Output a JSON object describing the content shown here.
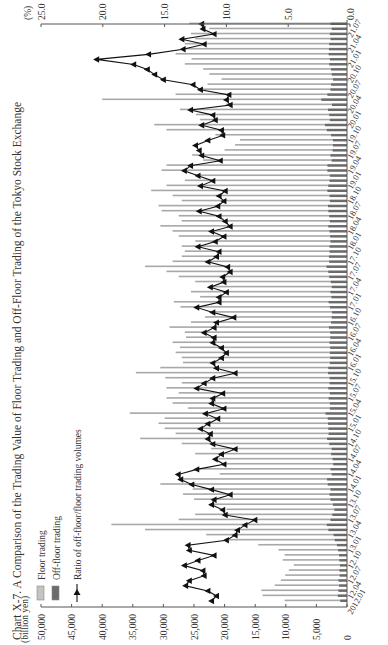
{
  "chart_data": {
    "type": "bar",
    "orientation": "rotated-90-ccw",
    "title": "Chart X-7.   A Comparison of the Trading Value of Floor Trading and Off-Floor Trading of the Tokyo Stock Exchange",
    "ylabel_left": "(billion yen)",
    "ylabel_right": "(%)",
    "ylim_left": [
      0,
      50000
    ],
    "ylim_right": [
      0,
      25
    ],
    "left_ticks": [
      "0",
      "5,000",
      "10,000",
      "15,000",
      "20,000",
      "25,000",
      "30,000",
      "35,000",
      "40,000",
      "45,000",
      "50,000"
    ],
    "right_ticks": [
      "0.0",
      "5.0",
      "10.0",
      "15.0",
      "20.0",
      "25.0"
    ],
    "x_tick_labels": [
      "2012.01",
      "12.04",
      "12.07",
      "12.10",
      "13.01",
      "13.04",
      "13.07",
      "13.10",
      "14.01",
      "14.04",
      "14.07",
      "14.10",
      "15.01",
      "15.04",
      "15.07",
      "15.10",
      "16.01",
      "16.04",
      "16.07",
      "16.10",
      "17.01",
      "17.04",
      "17.07",
      "17.10",
      "18.01",
      "18.04",
      "18.07",
      "18.10",
      "19.01",
      "19.04",
      "19.07",
      "19.10",
      "20.01",
      "20.04",
      "20.07",
      "20.10",
      "21.01",
      "21.04",
      "21.07"
    ],
    "legend": [
      "Floor trading",
      "Off-floor trading",
      "Ratio of off-floor/floor trading volumes"
    ],
    "grid": false,
    "series": [
      {
        "name": "Floor trading",
        "type": "bar",
        "axis": "left",
        "values": [
          10200,
          13800,
          14000,
          11800,
          10800,
          10100,
          9500,
          8700,
          10500,
          10200,
          11200,
          14500,
          20000,
          23000,
          33000,
          38500,
          27500,
          24800,
          19700,
          22500,
          25000,
          26800,
          25200,
          30500,
          27000,
          20800,
          24500,
          20600,
          21000,
          24800,
          22200,
          27000,
          33800,
          28000,
          29800,
          30800,
          29800,
          35500,
          26000,
          28500,
          29500,
          27500,
          29500,
          27000,
          29700,
          34500,
          30500,
          26800,
          27000,
          28000,
          27300,
          28500,
          26300,
          26500,
          29000,
          25500,
          23200,
          22500,
          27200,
          28300,
          24000,
          25500,
          22200,
          24800,
          27500,
          29500,
          33000,
          28500,
          27000,
          26500,
          27000,
          24800,
          27500,
          28500,
          30500,
          27000,
          27500,
          30300,
          30800,
          27000,
          28500,
          32000,
          29500,
          26500,
          24800,
          30300,
          29500,
          23500,
          25300,
          20000,
          18300,
          17500,
          21500,
          29500,
          31500,
          24000,
          24700,
          27300,
          19800,
          40000,
          28000,
          23500,
          22800,
          20500,
          22500,
          23500,
          26500,
          25400,
          28000,
          27000,
          26500,
          24800,
          25500,
          22500,
          25800
        ]
      },
      {
        "name": "Off-floor trading",
        "type": "bar",
        "axis": "left",
        "values": [
          1100,
          1500,
          1400,
          1300,
          1400,
          1200,
          1250,
          1150,
          1250,
          1300,
          1450,
          1650,
          2000,
          2200,
          3050,
          3300,
          2700,
          2400,
          2050,
          2300,
          2700,
          2850,
          2700,
          3150,
          3250,
          2500,
          2700,
          2250,
          2350,
          2600,
          2500,
          2900,
          3250,
          3000,
          3050,
          3100,
          3150,
          3500,
          2800,
          2800,
          3000,
          2800,
          3050,
          2850,
          2850,
          3100,
          3050,
          2800,
          2750,
          2800,
          2750,
          2850,
          2750,
          2750,
          2950,
          2600,
          2500,
          2450,
          2800,
          3000,
          2550,
          2700,
          2500,
          2650,
          2900,
          3050,
          3350,
          2900,
          2950,
          2850,
          2850,
          2700,
          2750,
          2850,
          3050,
          2800,
          2900,
          3050,
          3100,
          2800,
          2850,
          3200,
          3050,
          2850,
          2800,
          3200,
          3200,
          2500,
          2700,
          2350,
          2300,
          2300,
          2600,
          3300,
          3600,
          2800,
          2900,
          3100,
          2450,
          4200,
          3200,
          2700,
          2600,
          2300,
          2500,
          2600,
          2900,
          2800,
          3000,
          2950,
          2900,
          2700,
          2800,
          2500,
          2700
        ]
      },
      {
        "name": "Ratio of off-floor/floor trading volumes",
        "type": "line",
        "axis": "right",
        "values": [
          11.2,
          10.8,
          11.5,
          13.3,
          13.0,
          11.8,
          11.9,
          13.4,
          12.3,
          11.0,
          13.0,
          13.1,
          10.0,
          9.3,
          9.1,
          8.5,
          7.7,
          10.1,
          10.3,
          11.2,
          11.0,
          9.7,
          11.2,
          12.8,
          13.7,
          13.9,
          12.4,
          10.2,
          10.9,
          10.4,
          9.3,
          11.1,
          11.5,
          11.3,
          12.1,
          11.5,
          10.7,
          11.7,
          10.2,
          11.2,
          11.1,
          10.3,
          12.4,
          11.8,
          11.1,
          9.3,
          10.8,
          11.1,
          10.4,
          10.0,
          10.4,
          11.1,
          11.0,
          11.8,
          11.0,
          10.8,
          9.4,
          11.1,
          12.4,
          10.6,
          10.6,
          10.0,
          11.3,
          10.2,
          10.3,
          9.7,
          9.9,
          11.5,
          10.8,
          10.6,
          12.3,
          10.9,
          10.2,
          11.2,
          9.7,
          10.1,
          10.6,
          12.2,
          10.7,
          10.2,
          10.6,
          10.1,
          12.1,
          11.1,
          12.3,
          13.4,
          12.9,
          10.5,
          12.0,
          12.2,
          12.5,
          11.5,
          10.3,
          10.4,
          12.0,
          10.9,
          11.1,
          12.9,
          9.7,
          10.0,
          9.8,
          12.1,
          12.7,
          15.1,
          15.8,
          16.4,
          17.5,
          20.5,
          16.3,
          13.5,
          11.8,
          13.6,
          11.0,
          11.9,
          12.0
        ]
      }
    ]
  }
}
